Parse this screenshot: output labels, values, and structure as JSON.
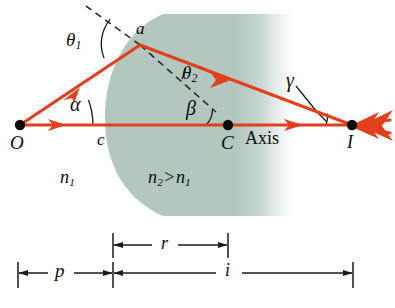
{
  "figure": {
    "kind": "optics-ray-diagram",
    "colors": {
      "ray": "#e0401c",
      "ray_dark": "#c23214",
      "medium_fill": "#b3c7bf",
      "construction": "#2a2a2a",
      "text": "#0d0d0d",
      "background": "#ffffff"
    }
  },
  "points": {
    "object": {
      "label": "O",
      "x": 20,
      "y": 125
    },
    "incidence": {
      "label": "a",
      "x": 140,
      "y": 45
    },
    "vertex": {
      "label": "c",
      "x": 113,
      "y": 125
    },
    "center": {
      "label": "C",
      "x": 228,
      "y": 125
    },
    "image": {
      "label": "I",
      "x": 352,
      "y": 125
    }
  },
  "angles": {
    "theta1": {
      "label": "θ",
      "sub": "1",
      "x": 70,
      "y": 32
    },
    "theta2": {
      "label": "θ",
      "sub": "2",
      "x": 184,
      "y": 68
    },
    "alpha": {
      "label": "α",
      "x": 73,
      "y": 98
    },
    "beta": {
      "label": "β",
      "x": 190,
      "y": 103
    },
    "gamma": {
      "label": "γ",
      "x": 290,
      "y": 76
    }
  },
  "media": {
    "n1": {
      "label": "n",
      "sub": "1",
      "x": 62,
      "y": 172
    },
    "n2": {
      "label": "n",
      "sub": "2",
      "op": ">",
      "label2": "n",
      "sub2": "1",
      "x": 150,
      "y": 172
    }
  },
  "axis": {
    "label": "Axis",
    "x": 247,
    "y": 134
  },
  "dimensions": [
    {
      "name": "r",
      "label": "r",
      "x1": 113,
      "x2": 228,
      "y": 245,
      "label_x": 165,
      "label_y": 232
    },
    {
      "name": "p",
      "label": "p",
      "x1": 18,
      "x2": 113,
      "y": 273,
      "label_x": 61,
      "label_y": 260
    },
    {
      "name": "i",
      "label": "i",
      "x1": 113,
      "x2": 353,
      "y": 273,
      "label_x": 229,
      "label_y": 260
    }
  ]
}
